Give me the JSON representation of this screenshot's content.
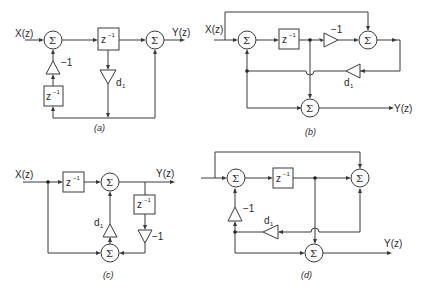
{
  "figure": {
    "panels": [
      {
        "id": "a",
        "caption": "(a)",
        "input": "X(z)",
        "output": "Y(z)",
        "sum": "Σ",
        "delay": "z",
        "delay_exp": "−1",
        "gain_neg": "−1",
        "gain_d": "d",
        "gain_d_sub": "1"
      },
      {
        "id": "b",
        "caption": "(b)",
        "input": "X(z)",
        "output": "Y(z)",
        "sum": "Σ",
        "delay": "z",
        "delay_exp": "−1",
        "gain_neg": "−1",
        "gain_d": "d",
        "gain_d_sub": "1"
      },
      {
        "id": "c",
        "caption": "(c)",
        "input": "X(z)",
        "output": "Y(z)",
        "sum": "Σ",
        "delay": "z",
        "delay_exp": "−1",
        "gain_neg": "−1",
        "gain_d": "d",
        "gain_d_sub": "1"
      },
      {
        "id": "d",
        "caption": "(d)",
        "input": "",
        "output": "Y(z)",
        "sum": "Σ",
        "delay": "z",
        "delay_exp": "−1",
        "gain_neg": "−1",
        "gain_d": "d",
        "gain_d_sub": "1"
      }
    ]
  }
}
